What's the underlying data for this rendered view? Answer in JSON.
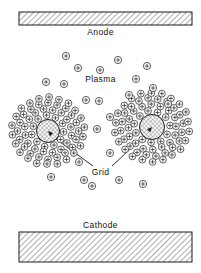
{
  "figure": {
    "width": 201,
    "height": 273,
    "background": "#ffffff",
    "ink": "#1a1a1a"
  },
  "labels": {
    "anode": "Anode",
    "cathode": "Cathode",
    "plasma": "Plasma",
    "grid": "Grid"
  },
  "electrodes": {
    "anode": {
      "name": "Anode",
      "x": 19,
      "y": 12,
      "width": 173,
      "height": 13,
      "fill": "hatch",
      "stroke": "#1a1a1a"
    },
    "cathode": {
      "name": "Cathode",
      "x": 19,
      "y": 232,
      "width": 173,
      "height": 30,
      "fill": "hatch",
      "stroke": "#1a1a1a"
    }
  },
  "grid_wires": [
    {
      "name": "grid-wire-left",
      "cx": 48,
      "cy": 131,
      "r": 11.5,
      "fill": "crosshatch"
    },
    {
      "name": "grid-wire-right",
      "cx": 152,
      "cy": 127,
      "r": 12.5,
      "fill": "crosshatch"
    }
  ],
  "leader_lines": [
    {
      "name": "leader-left",
      "x1": 93,
      "y1": 166,
      "x2": 56,
      "y2": 139
    },
    {
      "name": "leader-right",
      "x1": 112,
      "y1": 166,
      "x2": 143,
      "y2": 137
    }
  ],
  "ion_symbol": {
    "glyph": "circled-plus",
    "radius": 3.6,
    "stroke": "#2b2b2b"
  },
  "plasma_ions": [
    [
      118,
      60
    ],
    [
      78,
      68
    ],
    [
      100,
      70
    ],
    [
      147,
      66
    ],
    [
      46,
      82
    ],
    [
      64,
      84
    ],
    [
      136,
      79
    ],
    [
      153,
      88
    ],
    [
      86,
      100
    ],
    [
      99,
      101
    ],
    [
      110,
      117
    ],
    [
      97,
      129
    ],
    [
      79,
      162
    ],
    [
      110,
      153
    ],
    [
      84,
      180
    ],
    [
      119,
      180
    ],
    [
      143,
      184
    ],
    [
      168,
      104
    ],
    [
      66,
      56
    ],
    [
      129,
      95
    ],
    [
      92,
      186
    ],
    [
      51,
      177
    ]
  ],
  "sheath_clouds": [
    {
      "name": "ion-sheath-left",
      "cx": 48,
      "cy": 131,
      "rings": [
        {
          "r": 16.5,
          "count": 11,
          "phase": 0.1
        },
        {
          "r": 23.5,
          "count": 16,
          "phase": 0.22
        },
        {
          "r": 30.0,
          "count": 20,
          "phase": 0.05
        },
        {
          "r": 36.0,
          "count": 22,
          "phase": 0.3
        }
      ]
    },
    {
      "name": "ion-sheath-right",
      "cx": 152,
      "cy": 127,
      "rings": [
        {
          "r": 17.5,
          "count": 11,
          "phase": 0.35
        },
        {
          "r": 24.5,
          "count": 16,
          "phase": 0.12
        },
        {
          "r": 31.0,
          "count": 20,
          "phase": 0.28
        },
        {
          "r": 37.0,
          "count": 22,
          "phase": 0.02
        }
      ]
    }
  ]
}
